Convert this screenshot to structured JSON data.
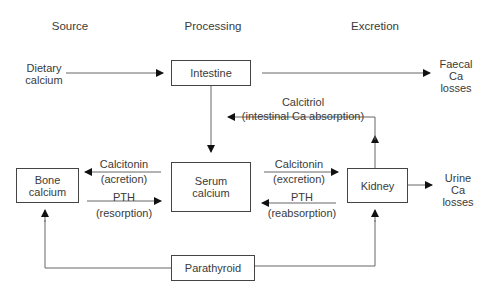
{
  "headers": {
    "source": "Source",
    "processing": "Processing",
    "excretion": "Excretion"
  },
  "nodes": {
    "dietary_calcium": {
      "line1": "Dietary",
      "line2": "calcium"
    },
    "intestine": "Intestine",
    "faecal_losses": {
      "line1": "Faecal",
      "line2": "Ca",
      "line3": "losses"
    },
    "bone_calcium": {
      "line1": "Bone",
      "line2": "calcium"
    },
    "serum_calcium": {
      "line1": "Serum",
      "line2": "calcium"
    },
    "kidney": "Kidney",
    "urine_losses": {
      "line1": "Urine",
      "line2": "Ca",
      "line3": "losses"
    },
    "parathyroid": "Parathyroid"
  },
  "edges": {
    "calcitriol": {
      "line1": "Calcitriol",
      "line2": "(intestinal Ca absorption)"
    },
    "calcitonin_bone": {
      "line1": "Calcitonin",
      "line2": "(acretion)"
    },
    "pth_bone": {
      "line1": "PTH",
      "line2": "(resorption)"
    },
    "calcitonin_kidney": {
      "line1": "Calcitonin",
      "line2": "(excretion)"
    },
    "pth_kidney": {
      "line1": "PTH",
      "line2": "(reabsorption)"
    }
  },
  "colors": {
    "line": "#555555",
    "text": "#3a3a3a"
  }
}
